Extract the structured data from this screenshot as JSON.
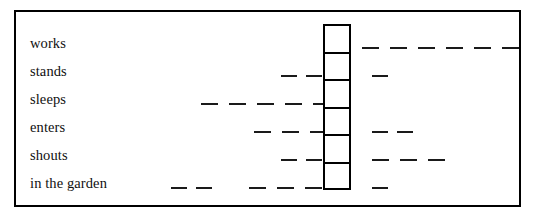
{
  "figure": {
    "kind": "slot-and-filler-diagram",
    "frame": {
      "border_color": "#000000",
      "background": "#ffffff"
    },
    "stroke_color": "#1a1a1a"
  },
  "slot_column": {
    "name": "empty-slot-column",
    "cell_count": 6,
    "cells": [
      "",
      "",
      "",
      "",
      "",
      ""
    ]
  },
  "rows": [
    {
      "label": "works",
      "left_segments": [],
      "right_segments": [
        {
          "start": 346,
          "width": 167
        }
      ]
    },
    {
      "label": "stands",
      "left_segments": [
        {
          "start": 265,
          "width": 45
        }
      ],
      "right_segments": [
        {
          "start": 356,
          "width": 19
        }
      ]
    },
    {
      "label": "sleeps",
      "left_segments": [
        {
          "start": 185,
          "width": 125
        }
      ],
      "right_segments": []
    },
    {
      "label": "enters",
      "left_segments": [
        {
          "start": 238,
          "width": 72
        }
      ],
      "right_segments": [
        {
          "start": 356,
          "width": 48
        }
      ]
    },
    {
      "label": "shouts",
      "left_segments": [
        {
          "start": 265,
          "width": 45
        }
      ],
      "right_segments": [
        {
          "start": 356,
          "width": 75
        }
      ]
    },
    {
      "label": "in the garden",
      "left_segments": [
        {
          "start": 155,
          "width": 42
        },
        {
          "start": 233,
          "width": 77
        }
      ],
      "right_segments": [
        {
          "start": 356,
          "width": 19
        }
      ]
    }
  ]
}
